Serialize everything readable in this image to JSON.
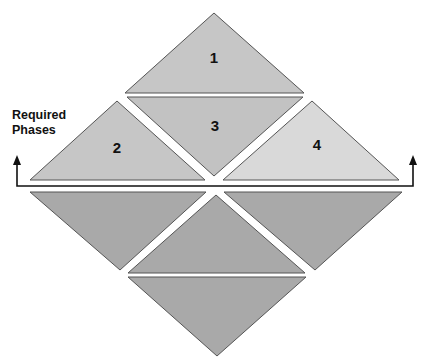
{
  "diagram": {
    "side_label_line1": "Required",
    "side_label_line2": "Phases",
    "colors": {
      "phase_fill": "#c4c4c4",
      "phase4_fill": "#d9d9d9",
      "lower_fill": "#a9a9a9",
      "stroke": "#555555",
      "arrow": "#111111"
    },
    "upper_triangles": [
      {
        "label": "1",
        "orientation": "up"
      },
      {
        "label": "3",
        "orientation": "down"
      },
      {
        "label": "2",
        "orientation": "up"
      },
      {
        "label": "4",
        "orientation": "up"
      }
    ],
    "lower_triangles": [
      {
        "label": "",
        "orientation": "down"
      },
      {
        "label": "",
        "orientation": "down"
      },
      {
        "label": "",
        "orientation": "up"
      },
      {
        "label": "",
        "orientation": "down"
      }
    ]
  }
}
